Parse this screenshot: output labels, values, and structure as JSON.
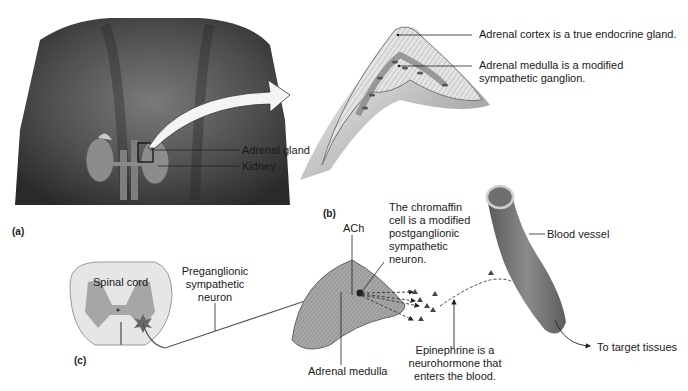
{
  "figure": {
    "panels": [
      {
        "id": "a",
        "tag": "(a)"
      },
      {
        "id": "b",
        "tag": "(b)"
      },
      {
        "id": "c",
        "tag": "(c)"
      }
    ],
    "panel_a": {
      "labels": {
        "adrenal_gland": "Adrenal gland",
        "kidney": "Kidney"
      }
    },
    "panel_b": {
      "labels": {
        "cortex": "Adrenal cortex is a true endocrine gland.",
        "medulla_line1": "Adrenal medulla is a modified",
        "medulla_line2": "sympathetic ganglion."
      }
    },
    "panel_c": {
      "labels": {
        "spinal_cord": "Spinal cord",
        "preganglionic_1": "Preganglionic",
        "preganglionic_2": "sympathetic",
        "preganglionic_3": "neuron",
        "ach": "ACh",
        "chromaffin_1": "The chromaffin",
        "chromaffin_2": "cell is a modified",
        "chromaffin_3": "postganglionic",
        "chromaffin_4": "sympathetic",
        "chromaffin_5": "neuron.",
        "adrenal_medulla": "Adrenal medulla",
        "epinephrine_1": "Epinephrine is a",
        "epinephrine_2": "neurohormone that",
        "epinephrine_3": "enters the blood.",
        "blood_vessel": "Blood vessel",
        "target": "To target tissues"
      }
    },
    "colors": {
      "skin_dark": "#3a3a3a",
      "skin_mid": "#6e6e6e",
      "organ_gray": "#9a9a9a",
      "tissue_light": "#d9d9d9",
      "vessel": "#7a7a7a",
      "line": "#222222"
    }
  }
}
